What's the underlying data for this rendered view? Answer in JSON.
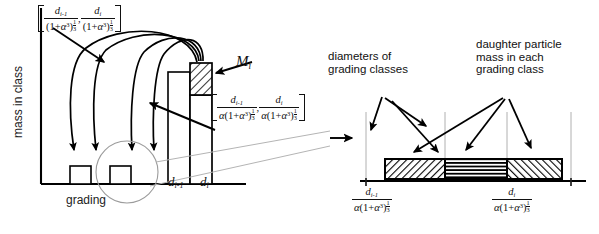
{
  "figure": {
    "background": "#ffffff",
    "ink": "#000000",
    "guide_color": "#a9a9a9"
  },
  "left_chart": {
    "type": "bar",
    "y_axis_label": "mass in class",
    "x_axis_label": "grading",
    "axis_ranges": {
      "x": [
        0,
        240
      ],
      "y": [
        0,
        185
      ]
    },
    "grid": false,
    "categories": [
      "class A",
      "class B",
      "class C",
      "class D",
      "parent class i"
    ],
    "bar_pixel_layout": [
      {
        "name": "class A",
        "x": 70,
        "width": 21,
        "height": 18
      },
      {
        "name": "class B",
        "x": 110,
        "width": 21,
        "height": 18
      },
      {
        "name": "class C",
        "x": 168,
        "width": 22,
        "height": 112
      },
      {
        "name": "class D (parent)",
        "x": 190,
        "width": 22,
        "height": 112
      }
    ],
    "parent_bar": {
      "label": "M_i",
      "label_plain": "Mi",
      "hatched_top_height": 32,
      "description": "daughter particle mass M_i removed from parent class"
    },
    "tick_labels": [
      "d_{i-1}",
      "d_i"
    ],
    "tick_labels_plain": [
      "di-1",
      "di"
    ],
    "arc_count": 4,
    "arc_description": "four curved arrows sweeping from parent class bar down into smaller grading classes",
    "highlight_circle": {
      "cx": 127,
      "cy": 172,
      "r": 31,
      "meaning": "detail region expanded at right"
    }
  },
  "formulas": {
    "top_interval": {
      "open_bracket": "[",
      "close_bracket": "]",
      "term1": {
        "numerator": "d",
        "numerator_sub": "i-1",
        "denominator_base": "(1+α³)",
        "denominator_exponent": "1/3"
      },
      "term2": {
        "numerator": "d",
        "numerator_sub": "i",
        "denominator_base": "(1+α³)",
        "denominator_exponent": "1/3"
      },
      "separator": ",",
      "plain": "[ d(i-1)/(1+a^3)^(1/3) , d(i)/(1+a^3)^(1/3) ]"
    },
    "mid_interval": {
      "open_bracket": "[",
      "close_bracket": "]",
      "term1": {
        "numerator": "d",
        "numerator_sub": "i-1",
        "denominator_base": "α(1+α³)",
        "denominator_exponent": "1/3"
      },
      "term2": {
        "numerator": "d",
        "numerator_sub": "i",
        "denominator_base": "α(1+α³)",
        "denominator_exponent": "1/3"
      },
      "separator": ",",
      "plain": "[ d(i-1)/(a(1+a^3)^(1/3)) , d(i)/(a(1+a^3)^(1/3)) ]"
    },
    "detail_left": {
      "numerator": "d",
      "numerator_sub": "i-1",
      "denominator_base": "α(1+α³)",
      "denominator_exponent": "1/3",
      "plain": "d(i-1) / (a(1+a^3)^(1/3))"
    },
    "detail_right": {
      "numerator": "d",
      "numerator_sub": "i",
      "denominator_base": "α(1+α³)",
      "denominator_exponent": "1/3",
      "plain": "d(i) / (a(1+a^3)^(1/3))"
    }
  },
  "right_detail": {
    "annotations": [
      {
        "id": "diameters",
        "lines": [
          "diameters of",
          "grading classes"
        ],
        "arrow_count": 2
      },
      {
        "id": "daughter",
        "lines": [
          "daughter particle",
          "mass in each",
          "grading class"
        ],
        "arrow_count": 3
      }
    ],
    "bar_segments": [
      {
        "index": 0,
        "fill": "diagonal-forward-hatch",
        "x": 385,
        "width": 60
      },
      {
        "index": 1,
        "fill": "horizontal-lines",
        "x": 445,
        "width": 62
      },
      {
        "index": 2,
        "fill": "diagonal-back-hatch",
        "x": 507,
        "width": 55
      }
    ],
    "bar_geometry": {
      "y": 159,
      "height": 20,
      "baseline_y": 181
    },
    "guide_x_positions": [
      366,
      445,
      507,
      571
    ],
    "axis_label_left": "d_{i-1} / (α(1+α³)^{1/3})",
    "axis_label_right": "d_i / (α(1+α³)^{1/3})"
  }
}
